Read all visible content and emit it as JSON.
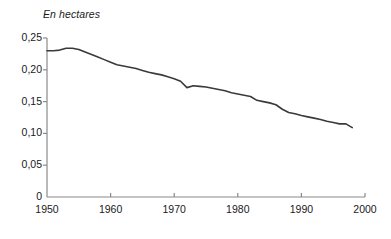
{
  "chart_data": {
    "type": "line",
    "title": "En hectares",
    "xlabel": "",
    "ylabel": "",
    "xlim": [
      1950,
      2000
    ],
    "ylim": [
      0,
      0.25
    ],
    "grid": false,
    "legend": null,
    "x_tick_labels": [
      "1950",
      "1960",
      "1970",
      "1980",
      "1990",
      "2000"
    ],
    "x_tick_values": [
      1950,
      1960,
      1970,
      1980,
      1990,
      2000
    ],
    "y_tick_labels": [
      "0",
      "0,05",
      "0,10",
      "0,15",
      "0,20",
      "0,25"
    ],
    "y_tick_values": [
      0,
      0.05,
      0.1,
      0.15,
      0.2,
      0.25
    ],
    "line_color": "#3a3a3a",
    "axis_color": "#8a8a8a",
    "x": [
      1950,
      1951,
      1952,
      1953,
      1954,
      1955,
      1956,
      1957,
      1958,
      1959,
      1960,
      1961,
      1962,
      1963,
      1964,
      1965,
      1966,
      1967,
      1968,
      1969,
      1970,
      1971,
      1972,
      1973,
      1974,
      1975,
      1976,
      1977,
      1978,
      1979,
      1980,
      1981,
      1982,
      1983,
      1984,
      1985,
      1986,
      1987,
      1988,
      1989,
      1990,
      1991,
      1992,
      1993,
      1994,
      1995,
      1996,
      1997,
      1998
    ],
    "values": [
      0.23,
      0.23,
      0.231,
      0.234,
      0.234,
      0.232,
      0.228,
      0.224,
      0.22,
      0.216,
      0.212,
      0.208,
      0.206,
      0.204,
      0.202,
      0.199,
      0.196,
      0.194,
      0.192,
      0.189,
      0.186,
      0.182,
      0.172,
      0.175,
      0.174,
      0.173,
      0.171,
      0.169,
      0.167,
      0.164,
      0.162,
      0.16,
      0.158,
      0.152,
      0.15,
      0.148,
      0.145,
      0.138,
      0.133,
      0.131,
      0.128,
      0.126,
      0.124,
      0.122,
      0.119,
      0.117,
      0.115,
      0.115,
      0.109
    ]
  }
}
